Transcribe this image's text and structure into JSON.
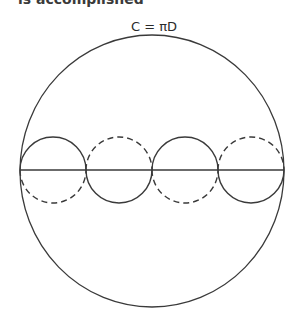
{
  "header": {
    "cropped_text": "is accomplished"
  },
  "diagram": {
    "title_formula": "C = πD",
    "stroke_color": "#3a3a3a",
    "background": "#ffffff",
    "outer_circle": {
      "cx": 152,
      "cy": 171,
      "rx": 132,
      "ry": 136
    },
    "diameter_line": {
      "x1": 20,
      "x2": 284,
      "y": 170
    },
    "small_circles": [
      {
        "cx": 53,
        "r": 33,
        "top": "solid",
        "bottom": "dashed"
      },
      {
        "cx": 119,
        "r": 33,
        "top": "dashed",
        "bottom": "solid"
      },
      {
        "cx": 185,
        "r": 33,
        "top": "solid",
        "bottom": "dashed"
      },
      {
        "cx": 251,
        "r": 33,
        "top": "dashed",
        "bottom": "solid"
      }
    ]
  }
}
